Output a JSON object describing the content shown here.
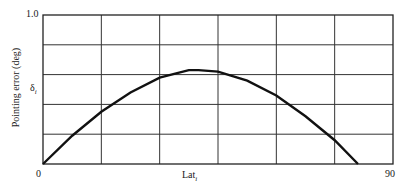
{
  "chart_data": {
    "type": "line",
    "title": "",
    "xlabel": "Lat_i",
    "ylabel": "Pointing error (deg)",
    "y_annotation": "δ_i",
    "xlim": [
      0,
      90
    ],
    "ylim": [
      0,
      1.0
    ],
    "x_tick_labels": [
      "0",
      "90"
    ],
    "y_tick_labels": [
      "1.0"
    ],
    "grid": true,
    "grid_columns": 6,
    "grid_rows": 5,
    "legend": null,
    "series": [
      {
        "name": "pointing error",
        "x": [
          0,
          7.5,
          15,
          22.5,
          30,
          37.5,
          40,
          45,
          52.5,
          60,
          67.5,
          75,
          81
        ],
        "y": [
          0,
          0.19,
          0.35,
          0.48,
          0.58,
          0.63,
          0.63,
          0.62,
          0.56,
          0.46,
          0.32,
          0.16,
          0
        ]
      }
    ]
  },
  "labels": {
    "y_top": "1.0",
    "x_origin": "0",
    "x_end": "90",
    "xlabel_main": "Lat",
    "xlabel_sub": "i",
    "ylabel": "Pointing error (deg)",
    "delta_main": "δ",
    "delta_sub": "i"
  }
}
